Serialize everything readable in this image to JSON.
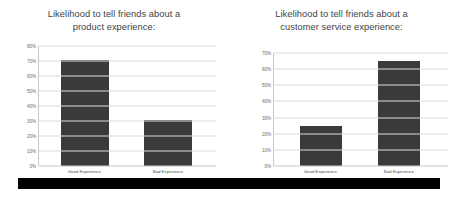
{
  "colors": {
    "bar_fill": "#3a3a3a",
    "gridline": "#dcdcdc",
    "axis": "#c8c8c8",
    "title_text": "#3f3f3f",
    "tick_text": "#6a6a6a",
    "bottom_strip": "#000000",
    "background": "#ffffff"
  },
  "chart_data": [
    {
      "type": "bar",
      "title": "Likelihood to tell friends about a product experience:",
      "title_line1": "Likelihood to tell friends about a",
      "title_line2": "product experience:",
      "categories": [
        "Good Experience",
        "Bad Experience"
      ],
      "values": [
        71,
        31
      ],
      "xlabel": "",
      "ylabel": "",
      "ylim": [
        0,
        80
      ],
      "ytick_values": [
        0,
        10,
        20,
        30,
        40,
        50,
        60,
        70,
        80
      ],
      "ytick_labels": [
        "0%",
        "10%",
        "20%",
        "30%",
        "40%",
        "50%",
        "60%",
        "70%",
        "80%"
      ],
      "grid": true,
      "legend": "none"
    },
    {
      "type": "bar",
      "title": "Likelihood to tell friends about a customer service experience:",
      "title_line1": "Likelihood to tell friends about a",
      "title_line2": "customer service experience:",
      "categories": [
        "Good Experience",
        "Bad Experience"
      ],
      "values": [
        25,
        65
      ],
      "xlabel": "",
      "ylabel": "",
      "ylim": [
        0,
        70
      ],
      "ytick_values": [
        0,
        10,
        20,
        30,
        40,
        50,
        60,
        70
      ],
      "ytick_labels": [
        "0%",
        "10%",
        "20%",
        "30%",
        "40%",
        "50%",
        "60%",
        "70%"
      ],
      "grid": true,
      "legend": "none"
    }
  ]
}
